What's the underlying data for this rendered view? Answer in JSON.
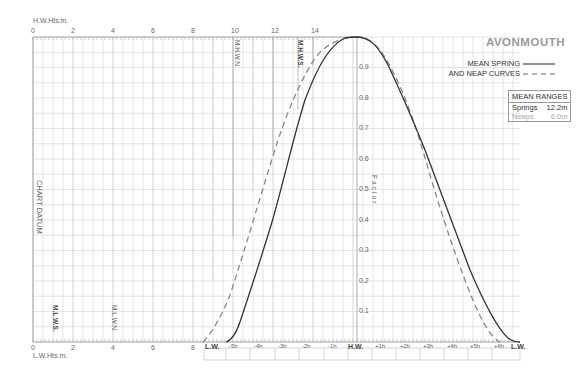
{
  "title": "AVONMOUTH",
  "legend": {
    "spring_label": "MEAN SPRING",
    "neap_label": "AND NEAP CURVES",
    "spring_style": "solid",
    "neap_style": "dashed"
  },
  "mean_ranges": {
    "header": "MEAN RANGES",
    "springs_label": "Springs",
    "springs_value": "12.2m",
    "neaps_label": "Neaps",
    "neaps_value": "6.0m"
  },
  "axes": {
    "hw_heights_label": "H.W.Hts.m.",
    "lw_heights_label": "L.W.Hts.m.",
    "chart_datum_label": "CHART DATUM",
    "factor_label": "Factor",
    "top_ticks": [
      "0",
      "2",
      "4",
      "6",
      "8",
      "10",
      "12",
      "14"
    ],
    "bottom_ticks": [
      "0",
      "2",
      "4",
      "6",
      "8"
    ],
    "factor_ticks": [
      "0.9",
      "0.8",
      "0.7",
      "0.6",
      "0.5",
      "0.4",
      "0.3",
      "0.2",
      "0.1"
    ],
    "time_ticks": [
      "L.W.",
      "-5h",
      "-4h",
      "-3h",
      "-2h",
      "-1h",
      "H.W.",
      "+1h",
      "+2h",
      "+3h",
      "+4h",
      "+5h",
      "+6h",
      "L.W."
    ]
  },
  "markers": {
    "mhwn": "M.H.W.N.",
    "mhws": "M.H.W.S.",
    "mlws": "M.L.W.S.",
    "mlwn": "M.L.W.N."
  },
  "colors": {
    "grid": "#c8c8c8",
    "grid_major": "#b0b0b0",
    "curve": "#333333",
    "neap_curve": "#888888",
    "text": "#555555"
  }
}
